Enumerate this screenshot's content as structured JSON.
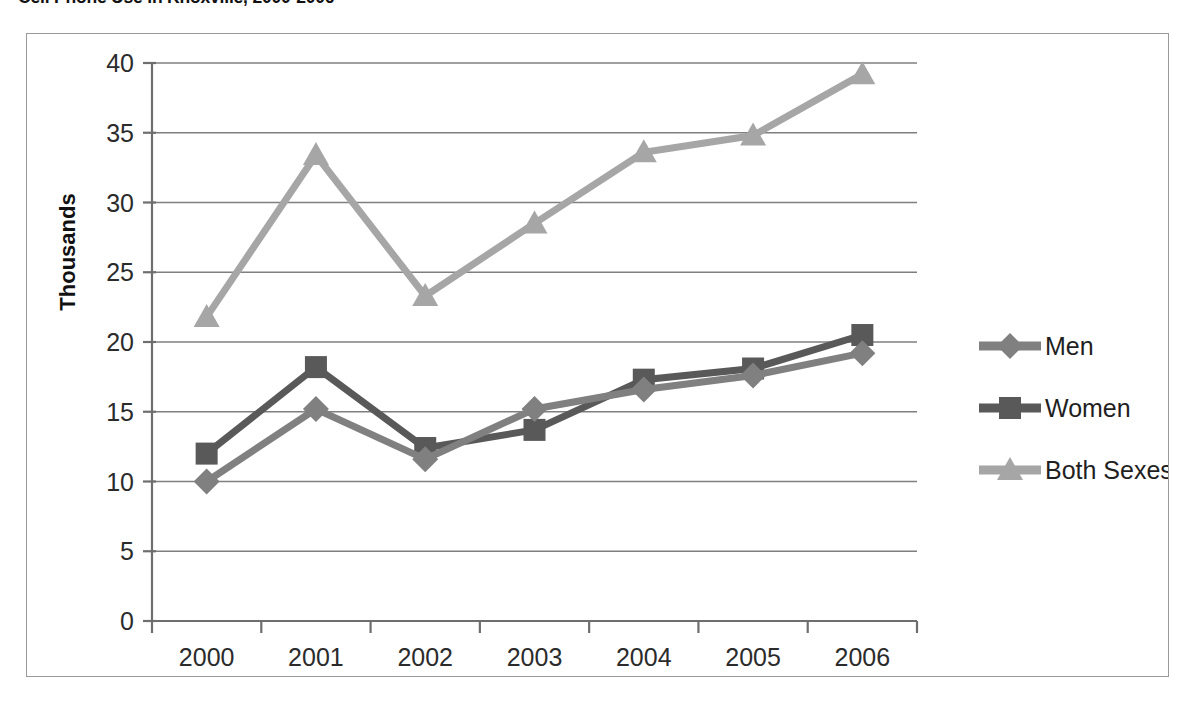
{
  "chart_title": "Cell Phone Use in Knoxville, 2000-2006",
  "axis": {
    "y_title": "Thousands",
    "y_ticks": [
      "0",
      "5",
      "10",
      "15",
      "20",
      "25",
      "30",
      "35",
      "40"
    ],
    "x_ticks": [
      "2000",
      "2001",
      "2002",
      "2003",
      "2004",
      "2005",
      "2006"
    ]
  },
  "legend": {
    "items": [
      {
        "label": "Men",
        "marker": "diamond",
        "color": "#808080"
      },
      {
        "label": "Women",
        "marker": "square",
        "color": "#595959"
      },
      {
        "label": "Both Sexes",
        "marker": "triangle",
        "color": "#a6a6a6"
      }
    ]
  },
  "chart_data": {
    "type": "line",
    "title": "Cell Phone Use in Knoxville, 2000-2006",
    "xlabel": "",
    "ylabel": "Thousands",
    "ylim": [
      0,
      40
    ],
    "ytick_step": 5,
    "grid": true,
    "legend_position": "right",
    "categories": [
      "2000",
      "2001",
      "2002",
      "2003",
      "2004",
      "2005",
      "2006"
    ],
    "series": [
      {
        "name": "Men",
        "marker": "diamond",
        "color": "#808080",
        "values": [
          10.0,
          15.2,
          11.6,
          15.2,
          16.6,
          17.6,
          19.2
        ]
      },
      {
        "name": "Women",
        "marker": "square",
        "color": "#595959",
        "values": [
          12.0,
          18.2,
          12.4,
          13.7,
          17.3,
          18.1,
          20.5
        ]
      },
      {
        "name": "Both Sexes",
        "marker": "triangle",
        "color": "#a6a6a6",
        "values": [
          21.8,
          33.4,
          23.3,
          28.5,
          33.6,
          34.8,
          39.2
        ]
      }
    ]
  }
}
